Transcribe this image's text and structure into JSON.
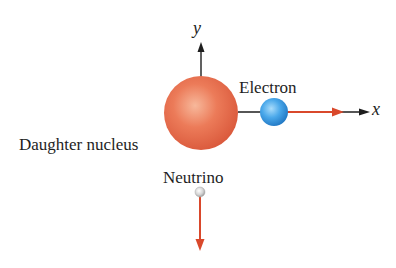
{
  "diagram": {
    "type": "beta-decay-momentum-diagram",
    "axes": {
      "x": {
        "label": "x"
      },
      "y": {
        "label": "y"
      }
    },
    "particles": [
      {
        "id": "daughter-nucleus",
        "label": "Daughter nucleus",
        "color": "#e8704f",
        "radius": 37
      },
      {
        "id": "electron",
        "label": "Electron",
        "color": "#3d9be0",
        "radius": 14,
        "momentum_direction": "+x"
      },
      {
        "id": "neutrino",
        "label": "Neutrino",
        "color": "#c8c8c8",
        "radius": 5,
        "momentum_direction": "-y"
      }
    ],
    "colors": {
      "axis": "#1e1e1e",
      "momentum_arrow": "#d9482b"
    }
  }
}
